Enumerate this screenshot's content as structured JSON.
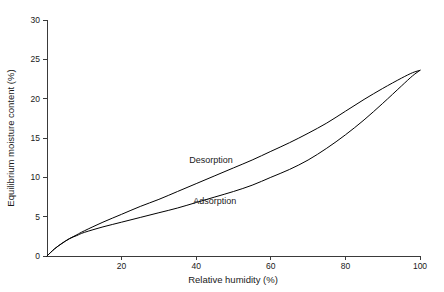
{
  "chart_data": {
    "type": "line",
    "title": "",
    "xlabel": "Relative humidity (%)",
    "ylabel": "Equilibrium moisture content (%)",
    "xlim": [
      0,
      100
    ],
    "ylim": [
      0,
      30
    ],
    "xticks": [
      0,
      20,
      40,
      60,
      80,
      100
    ],
    "xtick_labels": [
      "0",
      "20",
      "40",
      "60",
      "80",
      "100"
    ],
    "yticks": [
      0,
      5,
      10,
      15,
      20,
      25,
      30
    ],
    "ytick_labels": [
      "0",
      "5",
      "10",
      "15",
      "20",
      "25",
      "30"
    ],
    "grid": false,
    "legend_position": "inline-annotations",
    "annotations": [
      {
        "text": "Desorption",
        "x": 44,
        "y": 11.8
      },
      {
        "text": "Adsorption",
        "x": 45,
        "y": 6.6
      }
    ],
    "series": [
      {
        "name": "Desorption",
        "color": "#000000",
        "x": [
          0,
          2,
          4,
          6,
          8,
          10,
          15,
          20,
          25,
          30,
          35,
          40,
          45,
          50,
          55,
          60,
          65,
          70,
          75,
          80,
          85,
          90,
          95,
          98,
          100
        ],
        "values": [
          0.0,
          0.9,
          1.6,
          2.2,
          2.7,
          3.2,
          4.3,
          5.3,
          6.3,
          7.2,
          8.2,
          9.2,
          10.2,
          11.2,
          12.2,
          13.3,
          14.4,
          15.6,
          16.9,
          18.4,
          19.9,
          21.3,
          22.6,
          23.3,
          23.6
        ]
      },
      {
        "name": "Adsorption",
        "color": "#000000",
        "x": [
          0,
          2,
          4,
          6,
          8,
          10,
          15,
          20,
          25,
          30,
          35,
          40,
          45,
          50,
          55,
          60,
          65,
          70,
          75,
          80,
          85,
          90,
          95,
          98,
          100
        ],
        "values": [
          0.0,
          0.9,
          1.6,
          2.2,
          2.6,
          3.0,
          3.7,
          4.3,
          4.9,
          5.5,
          6.1,
          6.8,
          7.5,
          8.2,
          9.0,
          10.0,
          11.0,
          12.2,
          13.7,
          15.4,
          17.3,
          19.4,
          21.6,
          22.9,
          23.6
        ]
      }
    ]
  },
  "axes": {
    "x_title": "Relative humidity (%)",
    "y_title": "Equilibrium moisture content (%)"
  }
}
